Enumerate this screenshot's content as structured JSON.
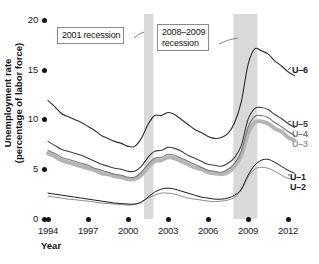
{
  "chart_data": {
    "type": "line",
    "title": "",
    "xlabel": "Year",
    "ylabel": "Unemployment rate\n(percentage of labor force)",
    "xlim": [
      1994,
      2012.9
    ],
    "ylim": [
      0,
      20
    ],
    "grid": false,
    "legend_position": "right-of-plot-line-ends",
    "x_ticks": [
      "1994",
      "1997",
      "2000",
      "2003",
      "2006",
      "2009",
      "2012"
    ],
    "y_ticks": [
      "0",
      "5",
      "10",
      "15",
      "20"
    ],
    "x": [
      1994,
      1994.5,
      1995,
      1995.5,
      1996,
      1996.5,
      1997,
      1997.5,
      1998,
      1998.5,
      1999,
      1999.5,
      2000,
      2000.5,
      2001,
      2001.5,
      2002,
      2002.5,
      2003,
      2003.5,
      2004,
      2004.5,
      2005,
      2005.5,
      2006,
      2006.5,
      2007,
      2007.5,
      2008,
      2008.5,
      2009,
      2009.5,
      2010,
      2010.5,
      2011,
      2011.5,
      2012,
      2012.5
    ],
    "series": [
      {
        "name": "U-1",
        "label": "U-1",
        "color": "#1a1a1a",
        "width": 1.0,
        "values": [
          2.6,
          2.5,
          2.4,
          2.3,
          2.2,
          2.1,
          2.0,
          1.9,
          1.8,
          1.7,
          1.6,
          1.55,
          1.5,
          1.5,
          1.7,
          2.2,
          2.7,
          3.0,
          3.1,
          3.0,
          2.8,
          2.6,
          2.4,
          2.2,
          2.1,
          2.0,
          2.0,
          2.1,
          2.4,
          3.0,
          4.4,
          5.4,
          5.9,
          6.0,
          5.7,
          5.3,
          4.9,
          4.6
        ]
      },
      {
        "name": "U-2",
        "label": "U-2",
        "color": "#8c8c8c",
        "width": 1.0,
        "values": [
          2.3,
          2.2,
          2.1,
          2.0,
          1.95,
          1.85,
          1.8,
          1.7,
          1.6,
          1.55,
          1.5,
          1.45,
          1.4,
          1.45,
          1.7,
          2.1,
          2.4,
          2.6,
          2.6,
          2.5,
          2.3,
          2.1,
          2.0,
          1.9,
          1.8,
          1.75,
          1.8,
          1.9,
          2.2,
          2.9,
          4.2,
          5.0,
          5.2,
          5.1,
          4.8,
          4.4,
          4.1,
          3.9
        ]
      },
      {
        "name": "U-3",
        "label": "U-3",
        "color": "#b5b5b5",
        "width": 4.0,
        "values": [
          6.6,
          6.3,
          5.9,
          5.7,
          5.5,
          5.3,
          5.1,
          4.9,
          4.6,
          4.5,
          4.3,
          4.2,
          4.0,
          4.0,
          4.4,
          5.2,
          5.8,
          5.9,
          6.2,
          6.1,
          5.8,
          5.5,
          5.2,
          5.0,
          4.7,
          4.6,
          4.5,
          4.7,
          5.3,
          6.4,
          8.6,
          9.7,
          9.8,
          9.6,
          9.1,
          8.8,
          8.2,
          7.9
        ]
      },
      {
        "name": "U-4",
        "label": "U-4",
        "color": "#777777",
        "width": 1.1,
        "values": [
          6.9,
          6.6,
          6.2,
          6.0,
          5.8,
          5.6,
          5.4,
          5.1,
          4.9,
          4.7,
          4.5,
          4.4,
          4.2,
          4.2,
          4.7,
          5.5,
          6.1,
          6.2,
          6.5,
          6.4,
          6.1,
          5.8,
          5.5,
          5.2,
          4.9,
          4.8,
          4.7,
          5.0,
          5.6,
          6.8,
          9.2,
          10.3,
          10.4,
          10.2,
          9.7,
          9.3,
          8.8,
          8.4
        ]
      },
      {
        "name": "U-5",
        "label": "U-5",
        "color": "#3d3d3d",
        "width": 1.1,
        "values": [
          7.8,
          7.4,
          7.0,
          6.8,
          6.6,
          6.4,
          6.1,
          5.8,
          5.5,
          5.3,
          5.1,
          5.0,
          4.8,
          4.8,
          5.3,
          6.2,
          6.8,
          6.9,
          7.2,
          7.1,
          6.8,
          6.4,
          6.1,
          5.8,
          5.5,
          5.4,
          5.3,
          5.6,
          6.2,
          7.4,
          10.0,
          11.1,
          11.2,
          11.0,
          10.5,
          10.1,
          9.6,
          9.2
        ]
      },
      {
        "name": "U-6",
        "label": "U-6",
        "color": "#2b2b2b",
        "width": 1.1,
        "values": [
          11.9,
          11.3,
          10.6,
          10.3,
          10.0,
          9.7,
          9.3,
          8.9,
          8.4,
          8.1,
          7.8,
          7.6,
          7.3,
          7.3,
          8.1,
          9.5,
          10.4,
          10.4,
          10.7,
          10.5,
          10.0,
          9.5,
          9.0,
          8.7,
          8.3,
          8.1,
          8.2,
          8.6,
          9.7,
          11.8,
          15.5,
          17.1,
          16.9,
          16.6,
          15.9,
          15.4,
          14.8,
          14.4
        ]
      }
    ],
    "shaded_regions": [
      {
        "name": "recession-2001",
        "label": "2001 recession",
        "start": 2001.2,
        "end": 2001.9,
        "color": "#d9d9d9"
      },
      {
        "name": "recession-2008-2009",
        "label": "2008–2009 recession",
        "start": 2007.9,
        "end": 2009.7,
        "color": "#d9d9d9"
      }
    ],
    "annotations": [
      {
        "name": "annotation-2001-recession",
        "text": "2001 recession"
      },
      {
        "name": "annotation-2008-2009-recession",
        "text": "2008–2009\nrecession"
      }
    ]
  },
  "axes": {
    "y_title": "Unemployment rate\n(percentage of labor force)",
    "x_title": "Year",
    "y_ticks": [
      {
        "value": "20",
        "y": 20
      },
      {
        "value": "15",
        "y": 70
      },
      {
        "value": "10",
        "y": 119
      },
      {
        "value": "5",
        "y": 169
      },
      {
        "value": "0",
        "y": 219
      }
    ],
    "x_ticks": [
      {
        "label": "1994",
        "x": 48
      },
      {
        "label": "1997",
        "x": 88
      },
      {
        "label": "2000",
        "x": 128
      },
      {
        "label": "2003",
        "x": 168
      },
      {
        "label": "2006",
        "x": 208
      },
      {
        "label": "2009",
        "x": 248
      },
      {
        "label": "2012",
        "x": 288
      }
    ]
  },
  "series_labels": {
    "u6": "U–6",
    "u5": "U–5",
    "u4": "U–4",
    "u3": "U–3",
    "u1": "U–1",
    "u2": "U–2"
  },
  "annotations": {
    "recession_2001": "2001 recession",
    "recession_2008_2009": "2008–2009\nrecession"
  },
  "colors": {
    "recession_band": "#d9d9d9",
    "u3_thick": "#b5b5b5",
    "axis_text": "#1a1a1a"
  }
}
